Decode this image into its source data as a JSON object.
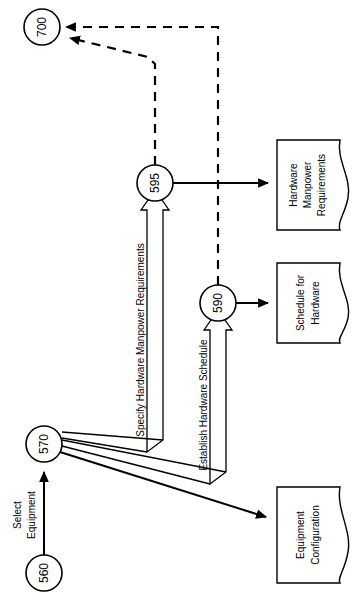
{
  "diagram": {
    "orientation": "rotated-90",
    "background_color": "#ffffff",
    "line_color": "#000000",
    "nodes": [
      {
        "id": "700",
        "label": "700",
        "cx": 42,
        "cy": 27,
        "r": 18
      },
      {
        "id": "595",
        "label": "595",
        "cx": 155,
        "cy": 183,
        "r": 18
      },
      {
        "id": "590",
        "label": "590",
        "cx": 218,
        "cy": 303,
        "r": 18
      },
      {
        "id": "570",
        "label": "570",
        "cx": 44,
        "cy": 444,
        "r": 18
      },
      {
        "id": "560",
        "label": "560",
        "cx": 44,
        "cy": 573,
        "r": 18
      }
    ],
    "documents": [
      {
        "id": "hardware-manpower-requirements",
        "lines": [
          "Hardware",
          "Manpower",
          "Requirements"
        ],
        "x": 277,
        "y": 140,
        "w": 72,
        "h": 90
      },
      {
        "id": "schedule-for-hardware",
        "lines": [
          "Schedule for",
          "Hardware"
        ],
        "x": 277,
        "y": 263,
        "w": 72,
        "h": 80
      },
      {
        "id": "equipment-configuration",
        "lines": [
          "Equipment",
          "Configuration"
        ],
        "x": 277,
        "y": 487,
        "w": 72,
        "h": 96
      }
    ],
    "edge_labels": [
      {
        "id": "specify-hardware-manpower-requirements",
        "text": "Specify Hardware Manpower Requirements"
      },
      {
        "id": "establish-hardware-schedule",
        "text": "Establish Hardware Schedule"
      },
      {
        "id": "select-equipment-line1",
        "text": "Select"
      },
      {
        "id": "select-equipment-line2",
        "text": "Equipment"
      }
    ],
    "edges": [
      {
        "from": "595",
        "to": "700",
        "style": "dashed"
      },
      {
        "from": "590",
        "to": "700",
        "style": "dashed"
      },
      {
        "from": "595",
        "to": "hardware-manpower-requirements",
        "style": "solid"
      },
      {
        "from": "590",
        "to": "schedule-for-hardware",
        "style": "solid"
      },
      {
        "from": "570",
        "to": "595",
        "style": "solid-labeled"
      },
      {
        "from": "570",
        "to": "590",
        "style": "solid-labeled"
      },
      {
        "from": "570",
        "to": "equipment-configuration",
        "style": "solid"
      },
      {
        "from": "560",
        "to": "570",
        "style": "solid-labeled"
      }
    ]
  }
}
